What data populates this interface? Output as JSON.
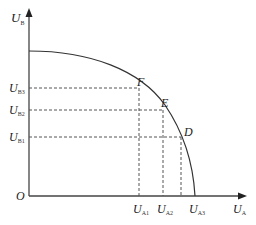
{
  "diagram": {
    "type": "utility-possibility-frontier",
    "axes": {
      "y": {
        "symbol": "U",
        "subscript": "B"
      },
      "x": {
        "symbol": "U",
        "subscript": "A"
      },
      "origin": "O"
    },
    "points": [
      {
        "label": "F",
        "x_tick": {
          "symbol": "U",
          "subscript": "A1"
        },
        "y_tick": {
          "symbol": "U",
          "subscript": "B3"
        }
      },
      {
        "label": "E",
        "x_tick": {
          "symbol": "U",
          "subscript": "A2"
        },
        "y_tick": {
          "symbol": "U",
          "subscript": "B2"
        }
      },
      {
        "label": "D",
        "x_tick": {
          "symbol": "U",
          "subscript": "A3"
        },
        "y_tick": {
          "symbol": "U",
          "subscript": "B1"
        }
      }
    ],
    "colors": {
      "line": "#333333",
      "dash": "#555555",
      "text": "#222222"
    }
  }
}
